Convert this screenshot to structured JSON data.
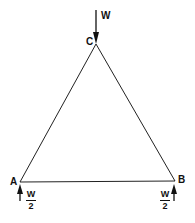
{
  "diagram": {
    "type": "truss",
    "nodes": [
      {
        "id": "A",
        "label": "A",
        "x": 20,
        "y": 182
      },
      {
        "id": "B",
        "label": "B",
        "x": 175,
        "y": 181
      },
      {
        "id": "C",
        "label": "C",
        "x": 96,
        "y": 44
      }
    ],
    "members": [
      [
        "A",
        "C"
      ],
      [
        "C",
        "B"
      ],
      [
        "A",
        "B"
      ]
    ],
    "loads": {
      "apex": {
        "label": "W",
        "node": "C",
        "direction": "down"
      },
      "reaction_a": {
        "numerator": "W",
        "denominator": "2",
        "node": "A",
        "direction": "up"
      },
      "reaction_b": {
        "numerator": "W",
        "denominator": "2",
        "node": "B",
        "direction": "up"
      }
    },
    "line_color": "#222222"
  }
}
